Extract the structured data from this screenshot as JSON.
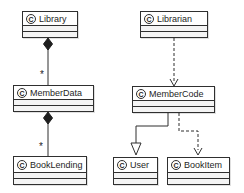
{
  "diagram": {
    "type": "uml-class-diagram",
    "icon_letter": "C",
    "colors": {
      "background": "#ffffff",
      "line": "#2f2f2f",
      "box_fill": "#ffffff",
      "compartment_fill": "#f4f4f4",
      "text": "#1e1e1e"
    },
    "classes": [
      {
        "name": "Library"
      },
      {
        "name": "Librarian"
      },
      {
        "name": "MemberData"
      },
      {
        "name": "MemberCode"
      },
      {
        "name": "BookLending"
      },
      {
        "name": "User"
      },
      {
        "name": "BookItem"
      }
    ],
    "relationships": [
      {
        "from": "Library",
        "to": "MemberData",
        "type": "composition",
        "multiplicity": "*"
      },
      {
        "from": "MemberData",
        "to": "BookLending",
        "type": "composition",
        "multiplicity": "*"
      },
      {
        "from": "Librarian",
        "to": "MemberCode",
        "type": "dependency"
      },
      {
        "from": "MemberCode",
        "to": "User",
        "type": "generalization"
      },
      {
        "from": "MemberCode",
        "to": "BookItem",
        "type": "dependency"
      }
    ]
  }
}
